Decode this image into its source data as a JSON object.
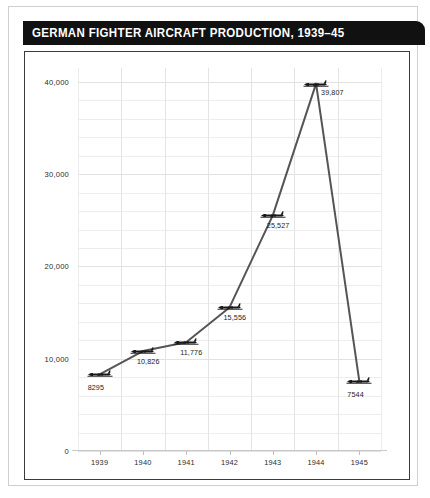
{
  "card": {
    "title": "GERMAN FIGHTER AIRCRAFT PRODUCTION, 1939–45"
  },
  "chart_data": {
    "type": "line",
    "title": "GERMAN FIGHTER AIRCRAFT PRODUCTION, 1939–45",
    "xlabel": "",
    "ylabel": "",
    "categories": [
      "1939",
      "1940",
      "1941",
      "1942",
      "1943",
      "1944",
      "1945"
    ],
    "values": [
      8295,
      10826,
      11776,
      15556,
      25527,
      39807,
      7544
    ],
    "point_labels": [
      "8295",
      "10,826",
      "11,776",
      "15,556",
      "25,527",
      "39,807",
      "7544"
    ],
    "ytick_labels": [
      "0",
      "10,000",
      "20,000",
      "30,000",
      "40,000"
    ],
    "ytick_values": [
      0,
      10000,
      20000,
      30000,
      40000
    ],
    "ylim": [
      0,
      41500
    ],
    "grid": true,
    "grid_step": 2000,
    "legend": "none",
    "marker": "airplane-silhouette",
    "line_color": "#555555",
    "marker_color": "#1a1a1a",
    "grid_color": "#ededed",
    "title_bar_color": "#111111",
    "title_text_color": "#ffffff"
  }
}
